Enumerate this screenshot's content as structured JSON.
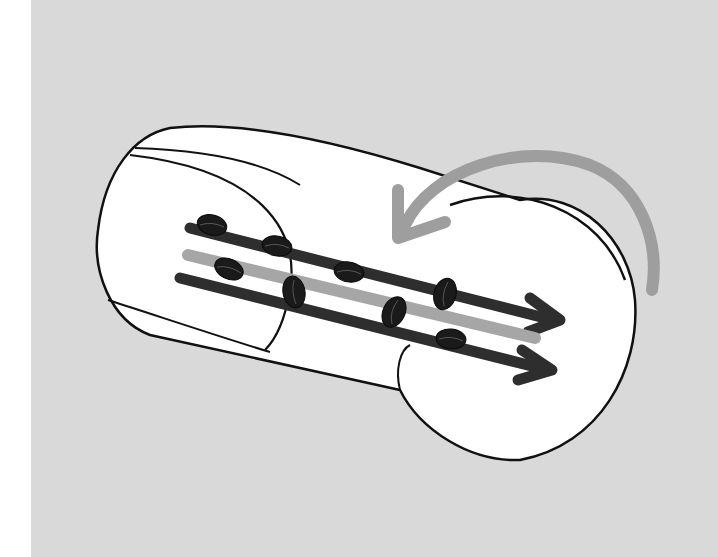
{
  "illustration": {
    "subject": "rotating drum with coffee beans",
    "colors": {
      "page": "#ffffff",
      "background_panel": "#d9d9d9",
      "drum_fill": "#ffffff",
      "outline": "#111111",
      "flow_arrow_dark": "#2e2e2e",
      "flow_arrow_light": "#a6a6a6",
      "rotation_arrow": "#9e9e9e",
      "bean": "#1a1a1a"
    },
    "elements": {
      "drum": "cylinder-drum",
      "rotation_arrow": "curved-rotation-arrow",
      "flow_arrows": [
        "flow-arrow-top",
        "flow-arrow-middle",
        "flow-arrow-bottom"
      ],
      "beans_count": 8
    }
  }
}
